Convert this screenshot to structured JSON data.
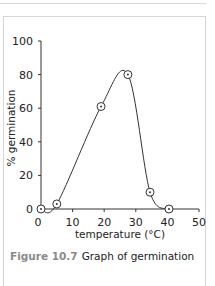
{
  "chart_data": {
    "type": "line",
    "title": "",
    "xlabel": "temperature (°C)",
    "ylabel": "% germination",
    "xlim": [
      0,
      50
    ],
    "ylim": [
      0,
      100
    ],
    "xticks": [
      0,
      10,
      20,
      30,
      40,
      50
    ],
    "yticks": [
      0,
      20,
      40,
      60,
      80,
      100
    ],
    "grid": false,
    "legend": null,
    "series": [
      {
        "name": "germination",
        "marker": "circle",
        "smooth": true,
        "x": [
          0,
          5,
          19,
          27.5,
          34.5,
          40.5
        ],
        "y": [
          0,
          3,
          61,
          80,
          10,
          0
        ]
      }
    ]
  },
  "caption": {
    "figure_label": "Figure 10.7",
    "text": "Graph of germination"
  },
  "axes": {
    "x_tick_labels": [
      "0",
      "10",
      "20",
      "30",
      "40",
      "50"
    ],
    "y_tick_labels": [
      "0",
      "20",
      "40",
      "60",
      "80",
      "100"
    ],
    "x_title": "temperature (°C)",
    "y_title": "% germination"
  }
}
